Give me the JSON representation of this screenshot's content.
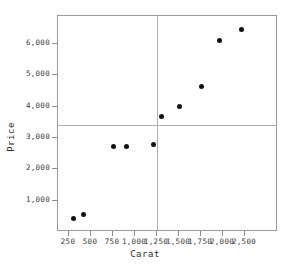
{
  "chart_data": {
    "type": "scatter",
    "title": "",
    "xlabel": "Carat",
    "ylabel": "Price",
    "xlim": [
      125,
      2625
    ],
    "ylim": [
      0,
      6900
    ],
    "grid": false,
    "legend": "none",
    "x_ticks": [
      {
        "value": 250,
        "label": "250"
      },
      {
        "value": 500,
        "label": "500"
      },
      {
        "value": 750,
        "label": "750"
      },
      {
        "value": 1000,
        "label": "1,000"
      },
      {
        "value": 1250,
        "label": "1,250"
      },
      {
        "value": 1500,
        "label": "1,500"
      },
      {
        "value": 1750,
        "label": "1,750"
      },
      {
        "value": 2000,
        "label": "2,000"
      },
      {
        "value": 2250,
        "label": "2,500"
      }
    ],
    "y_ticks": [
      {
        "value": 1000,
        "label": "1,000"
      },
      {
        "value": 2000,
        "label": "2,000"
      },
      {
        "value": 3000,
        "label": "3,000"
      },
      {
        "value": 4000,
        "label": "4,000"
      },
      {
        "value": 5000,
        "label": "5,000"
      },
      {
        "value": 6000,
        "label": "6,000"
      }
    ],
    "points": [
      {
        "x": 300,
        "y": 420
      },
      {
        "x": 410,
        "y": 570
      },
      {
        "x": 750,
        "y": 2740
      },
      {
        "x": 900,
        "y": 2740
      },
      {
        "x": 1205,
        "y": 2780
      },
      {
        "x": 1305,
        "y": 3690
      },
      {
        "x": 1500,
        "y": 4000
      },
      {
        "x": 1750,
        "y": 4660
      },
      {
        "x": 1965,
        "y": 6110
      },
      {
        "x": 2215,
        "y": 6480
      }
    ],
    "reference_lines": [
      {
        "orientation": "horizontal",
        "value": 3430,
        "color": "#b0b0b0"
      },
      {
        "orientation": "vertical",
        "value": 1255,
        "color": "#b0b0b0"
      }
    ],
    "marker": {
      "color": "#111111",
      "shape": "circle",
      "size": 5
    },
    "frame_color": "#9a9a9a"
  }
}
